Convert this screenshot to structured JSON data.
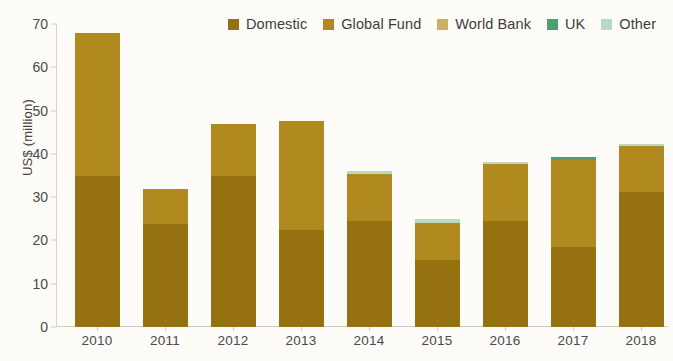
{
  "chart_data": {
    "type": "bar",
    "stacked": true,
    "title": "",
    "xlabel": "",
    "ylabel": "US$ (million)",
    "ylim": [
      0,
      70
    ],
    "yticks": [
      0,
      10,
      20,
      30,
      40,
      50,
      60,
      70
    ],
    "grid": false,
    "legend_position": "top-right",
    "categories": [
      "2010",
      "2011",
      "2012",
      "2013",
      "2014",
      "2015",
      "2016",
      "2017",
      "2018"
    ],
    "series": [
      {
        "name": "Domestic",
        "color": "#96710f",
        "values": [
          35.0,
          23.9,
          35.0,
          22.5,
          24.6,
          15.4,
          24.6,
          18.5,
          31.2
        ]
      },
      {
        "name": "Global Fund",
        "color": "#b08a1e",
        "values": [
          33.0,
          8.1,
          12.0,
          25.2,
          10.8,
          8.6,
          13.0,
          20.0,
          10.6
        ]
      },
      {
        "name": "World Bank",
        "color": "#cbb067",
        "values": [
          0,
          0,
          0,
          0,
          0,
          0,
          0,
          0,
          0
        ]
      },
      {
        "name": "UK",
        "color": "#4d9f72",
        "values": [
          0,
          0,
          0,
          0,
          0,
          0,
          0,
          0.8,
          0
        ]
      },
      {
        "name": "Other",
        "color": "#b9d9c2",
        "values": [
          0,
          0,
          0,
          0,
          0.6,
          1.0,
          0.5,
          0,
          0.4
        ]
      }
    ],
    "totals": [
      68.0,
      32.0,
      47.0,
      47.7,
      36.0,
      25.0,
      38.1,
      39.3,
      42.2
    ]
  },
  "legend": {
    "items": [
      {
        "label": "Domestic",
        "color": "#96710f"
      },
      {
        "label": "Global Fund",
        "color": "#b08a1e"
      },
      {
        "label": "World Bank",
        "color": "#cbb067"
      },
      {
        "label": "UK",
        "color": "#4d9f72"
      },
      {
        "label": "Other",
        "color": "#b9d9c2"
      }
    ]
  },
  "axes": {
    "y_title": "US$ (million)",
    "y_tick_labels": [
      "70",
      "60",
      "50",
      "40",
      "30",
      "20",
      "10",
      "0"
    ],
    "x_tick_labels": [
      "2010",
      "2011",
      "2012",
      "2013",
      "2014",
      "2015",
      "2016",
      "2017",
      "2018"
    ]
  },
  "colors": {
    "background": "#fdfcf8",
    "axis": "#d3cec0",
    "tick_text": "#4a4a4a"
  }
}
